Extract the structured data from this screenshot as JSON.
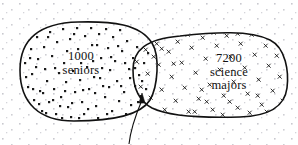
{
  "figure": {
    "kind": "venn-diagram",
    "colors": {
      "ink": "#111111",
      "background": "#ffffff",
      "inside_marker": "#1a1a1a",
      "outside_marker": "#c9c9cf"
    },
    "left_set": {
      "count": "1000",
      "noun": "seniors",
      "marker": "dot"
    },
    "right_set": {
      "count": "7200",
      "noun": "science",
      "noun2": "majors",
      "marker": "cross"
    },
    "annotation": {
      "arrow": "curved-arrow-pointing-to-intersection"
    }
  }
}
